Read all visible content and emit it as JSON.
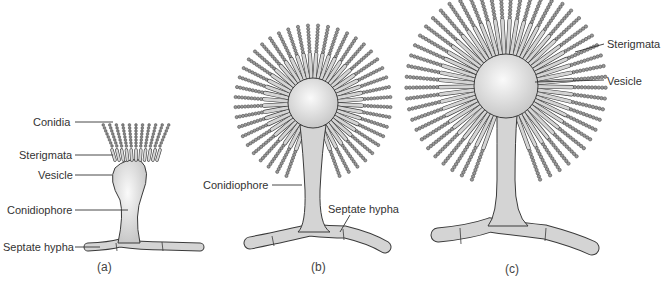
{
  "figure": {
    "panels": [
      {
        "id": "a",
        "caption": "(a)",
        "labels": [
          "Conidia",
          "Sterigmata",
          "Vesicle",
          "Conidiophore",
          "Septate hypha"
        ]
      },
      {
        "id": "b",
        "caption": "(b)",
        "labels": [
          "Conidiophore",
          "Septate hypha"
        ]
      },
      {
        "id": "c",
        "caption": "(c)",
        "labels": [
          "Sterigmata",
          "Vesicle"
        ]
      }
    ],
    "colors": {
      "fill": "#d4d4d4",
      "vesicle": "#e8e8e8",
      "stroke": "#3a3a3a",
      "text": "#333333"
    }
  }
}
